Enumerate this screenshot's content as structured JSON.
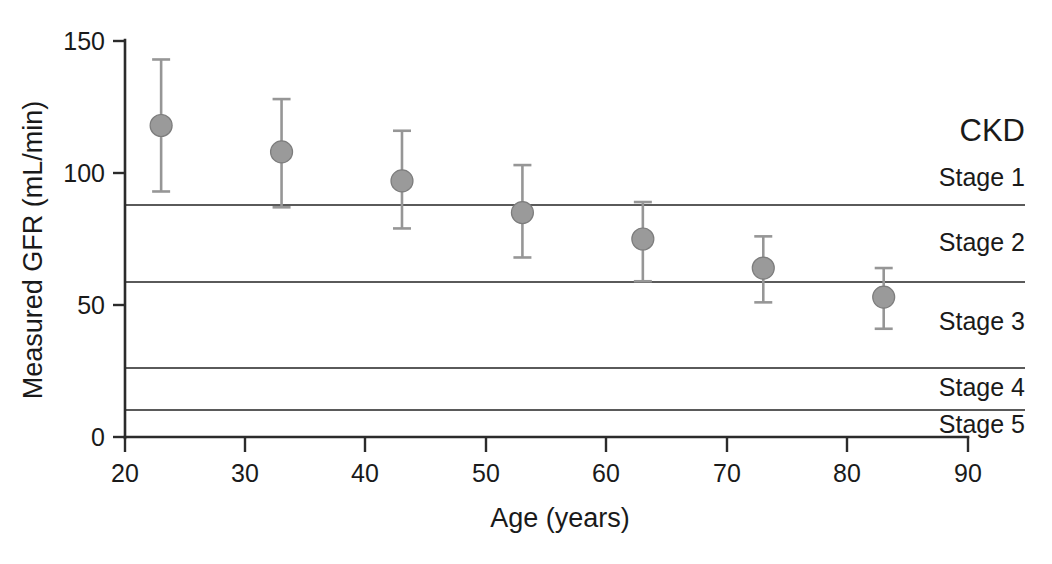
{
  "chart_data": {
    "type": "scatter",
    "title": "",
    "xlabel": "Age (years)",
    "ylabel": "Measured GFR (mL/min)",
    "xlim": [
      20,
      90
    ],
    "ylim": [
      0,
      150
    ],
    "xticks": [
      20,
      30,
      40,
      50,
      60,
      70,
      80,
      90
    ],
    "yticks": [
      0,
      50,
      100,
      150
    ],
    "xtick_labels": [
      "20",
      "30",
      "40",
      "50",
      "60",
      "70",
      "80",
      "90"
    ],
    "ytick_labels": [
      "0",
      "50",
      "100",
      "150"
    ],
    "grid": false,
    "legend": "none",
    "marker_color": "#9a9a9a",
    "errorbar_color": "#969696",
    "axis_color": "#2b2b2b",
    "stage_line_color": "#5a5a5a",
    "x": [
      23,
      33,
      43,
      53,
      63,
      73,
      83
    ],
    "y": [
      118,
      108,
      97,
      85,
      75,
      64,
      53
    ],
    "yerr_upper": [
      143,
      128,
      116,
      103,
      89,
      76,
      64
    ],
    "yerr_lower": [
      93,
      87,
      79,
      68,
      59,
      51,
      41
    ],
    "series": [
      {
        "name": "Measured GFR",
        "points": [
          {
            "age": 23,
            "gfr": 118,
            "ci_low": 93,
            "ci_high": 143
          },
          {
            "age": 33,
            "gfr": 108,
            "ci_low": 87,
            "ci_high": 128
          },
          {
            "age": 43,
            "gfr": 97,
            "ci_low": 79,
            "ci_high": 116
          },
          {
            "age": 53,
            "gfr": 85,
            "ci_low": 68,
            "ci_high": 103
          },
          {
            "age": 63,
            "gfr": 75,
            "ci_low": 59,
            "ci_high": 89
          },
          {
            "age": 73,
            "gfr": 64,
            "ci_low": 51,
            "ci_high": 76
          },
          {
            "age": 83,
            "gfr": 53,
            "ci_low": 41,
            "ci_high": 64
          }
        ]
      }
    ],
    "annotations": {
      "group_title": "CKD",
      "threshold_lines": [
        88,
        60,
        30,
        15
      ],
      "stage_bands": [
        {
          "label": "Stage 1",
          "gfr_center": 112
        },
        {
          "label": "Stage 2",
          "gfr_center": 74
        },
        {
          "label": "Stage 3",
          "gfr_center": 45
        },
        {
          "label": "Stage 4",
          "gfr_center": 22
        },
        {
          "label": "Stage 5",
          "gfr_center": 7
        }
      ]
    }
  },
  "labels": {
    "ckd_title": "CKD",
    "stage_1": "Stage 1",
    "stage_2": "Stage 2",
    "stage_3": "Stage 3",
    "stage_4": "Stage 4",
    "stage_5": "Stage 5",
    "x_axis_title": "Age (years)",
    "y_axis_title": "Measured GFR (mL/min)",
    "ytick_150": "150",
    "ytick_100": "100",
    "ytick_50": "50",
    "ytick_0": "0",
    "xtick_20": "20",
    "xtick_30": "30",
    "xtick_40": "40",
    "xtick_50": "50",
    "xtick_60": "60",
    "xtick_70": "70",
    "xtick_80": "80",
    "xtick_90": "90"
  }
}
